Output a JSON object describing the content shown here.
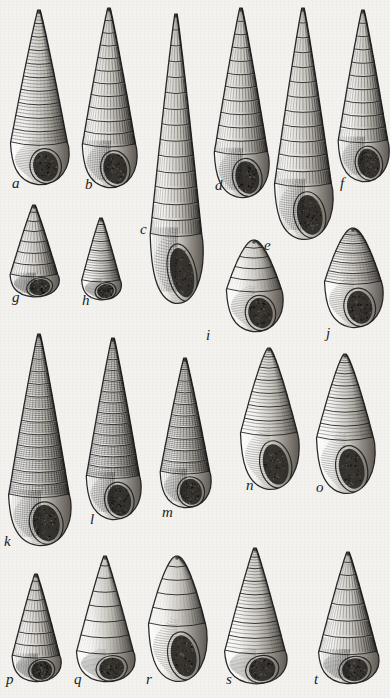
{
  "plate": {
    "title": "Plate of gastropod shells",
    "description": "Engraved scientific illustration plate showing twenty marine gastropod (sea snail) shells arranged in four rows, each lettered.",
    "background_color": "#f3f2ef",
    "ink_color": "#1c1c1c",
    "width": 390,
    "height": 698,
    "label_count": 20
  },
  "figures": [
    {
      "id": "a",
      "label": "a",
      "name": "shell-a",
      "form": "turreted-conic",
      "sculpture": "smooth-spiral-bands",
      "whorls": 10,
      "x": 8,
      "y": 10,
      "w": 62,
      "h": 175,
      "label_x": 12,
      "label_y": 176
    },
    {
      "id": "b",
      "label": "b",
      "name": "shell-b",
      "form": "elongate-turreted",
      "sculpture": "axial-ribs",
      "whorls": 11,
      "x": 80,
      "y": 8,
      "w": 58,
      "h": 180,
      "label_x": 85,
      "label_y": 177
    },
    {
      "id": "c",
      "label": "c",
      "name": "shell-c",
      "form": "very-elongate-turreted",
      "sculpture": "strong-axial-ribs",
      "whorls": 14,
      "x": 148,
      "y": 14,
      "w": 56,
      "h": 290,
      "label_x": 140,
      "label_y": 222
    },
    {
      "id": "d",
      "label": "d",
      "name": "shell-d",
      "form": "elongate-turreted",
      "sculpture": "axial-ribs",
      "whorls": 11,
      "x": 212,
      "y": 8,
      "w": 58,
      "h": 190,
      "label_x": 215,
      "label_y": 178
    },
    {
      "id": "e",
      "label": "e",
      "name": "shell-e",
      "form": "elongate-turreted",
      "sculpture": "strong-axial-ribs",
      "whorls": 12,
      "x": 272,
      "y": 8,
      "w": 62,
      "h": 232,
      "label_x": 264,
      "label_y": 238
    },
    {
      "id": "f",
      "label": "f",
      "name": "shell-f",
      "form": "turreted",
      "sculpture": "axial-ribs",
      "whorls": 10,
      "x": 336,
      "y": 10,
      "w": 54,
      "h": 172,
      "label_x": 340,
      "label_y": 176
    },
    {
      "id": "g",
      "label": "g",
      "name": "shell-g",
      "form": "ovate-conic",
      "sculpture": "axial-ribs",
      "whorls": 7,
      "x": 8,
      "y": 205,
      "w": 52,
      "h": 92,
      "label_x": 12,
      "label_y": 290
    },
    {
      "id": "h",
      "label": "h",
      "name": "shell-h",
      "form": "small-turbinate",
      "sculpture": "spiral-cords",
      "whorls": 7,
      "x": 80,
      "y": 218,
      "w": 42,
      "h": 82,
      "label_x": 82,
      "label_y": 293
    },
    {
      "id": "i",
      "label": "i",
      "name": "shell-i",
      "form": "ovate-pupoid",
      "sculpture": "smooth",
      "whorls": 5,
      "x": 224,
      "y": 240,
      "w": 60,
      "h": 92,
      "label_x": 206,
      "label_y": 328
    },
    {
      "id": "j",
      "label": "j",
      "name": "shell-j",
      "form": "ovate-globose",
      "sculpture": "smooth-granulate",
      "whorls": 6,
      "x": 322,
      "y": 228,
      "w": 62,
      "h": 100,
      "label_x": 326,
      "label_y": 326
    },
    {
      "id": "k",
      "label": "k",
      "name": "shell-k",
      "form": "very-elongate-turreted",
      "sculpture": "cancellate",
      "whorls": 13,
      "x": 6,
      "y": 334,
      "w": 66,
      "h": 212,
      "label_x": 4,
      "label_y": 534
    },
    {
      "id": "l",
      "label": "l",
      "name": "shell-l",
      "form": "elongate-turreted",
      "sculpture": "cancellate",
      "whorls": 13,
      "x": 84,
      "y": 338,
      "w": 58,
      "h": 182,
      "label_x": 90,
      "label_y": 512
    },
    {
      "id": "m",
      "label": "m",
      "name": "shell-m",
      "form": "turreted-conic",
      "sculpture": "beaded-cancellate",
      "whorls": 10,
      "x": 158,
      "y": 358,
      "w": 54,
      "h": 150,
      "label_x": 162,
      "label_y": 505
    },
    {
      "id": "n",
      "label": "n",
      "name": "shell-n",
      "form": "fusiform",
      "sculpture": "spiral-cords",
      "whorls": 7,
      "x": 238,
      "y": 348,
      "w": 62,
      "h": 142,
      "label_x": 246,
      "label_y": 478
    },
    {
      "id": "o",
      "label": "o",
      "name": "shell-o",
      "form": "fusiform",
      "sculpture": "spiral-cords",
      "whorls": 7,
      "x": 314,
      "y": 354,
      "w": 62,
      "h": 140,
      "label_x": 316,
      "label_y": 480
    },
    {
      "id": "p",
      "label": "p",
      "name": "shell-p",
      "form": "ovate-conic",
      "sculpture": "axial-ribs",
      "whorls": 8,
      "x": 10,
      "y": 574,
      "w": 52,
      "h": 108,
      "label_x": 6,
      "label_y": 672
    },
    {
      "id": "q",
      "label": "q",
      "name": "shell-q",
      "form": "ovate-conic",
      "sculpture": "smooth",
      "whorls": 7,
      "x": 74,
      "y": 556,
      "w": 62,
      "h": 126,
      "label_x": 74,
      "label_y": 672
    },
    {
      "id": "r",
      "label": "r",
      "name": "shell-r",
      "form": "ovate-smooth",
      "sculpture": "smooth",
      "whorls": 5,
      "x": 146,
      "y": 556,
      "w": 62,
      "h": 126,
      "label_x": 146,
      "label_y": 672
    },
    {
      "id": "s",
      "label": "s",
      "name": "shell-s",
      "form": "conic-ovate",
      "sculpture": "spiral-bands",
      "whorls": 8,
      "x": 222,
      "y": 548,
      "w": 66,
      "h": 136,
      "label_x": 226,
      "label_y": 672
    },
    {
      "id": "t",
      "label": "t",
      "name": "shell-t",
      "form": "ovate-conic",
      "sculpture": "strong-axial-ribs",
      "whorls": 7,
      "x": 316,
      "y": 552,
      "w": 64,
      "h": 132,
      "label_x": 314,
      "label_y": 672
    }
  ]
}
